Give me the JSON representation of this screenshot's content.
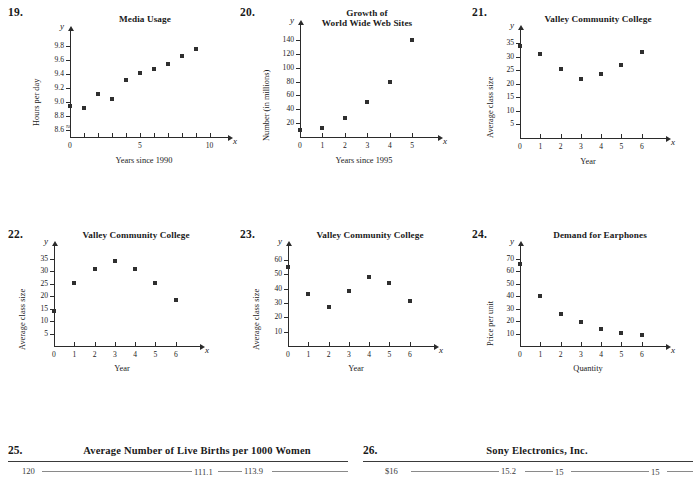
{
  "page": {
    "background": "#ffffff",
    "ink": "#1a1a1a"
  },
  "problems": [
    {
      "number": "19.",
      "title": "Media Usage",
      "xlabel": "Years since 1990",
      "ylabel": "Hours per day",
      "xvar": "x",
      "yvar": "y"
    },
    {
      "number": "20.",
      "title_line1": "Growth of",
      "title_line2": "World Wide Web Sites",
      "xlabel": "Years since 1995",
      "ylabel": "Number (in millions)",
      "xvar": "x",
      "yvar": "y"
    },
    {
      "number": "21.",
      "title": "Valley Community College",
      "xlabel": "Year",
      "ylabel": "Average class size",
      "xvar": "x",
      "yvar": "y"
    },
    {
      "number": "22.",
      "title": "Valley Community College",
      "xlabel": "Year",
      "ylabel": "Average class size",
      "xvar": "x",
      "yvar": "y"
    },
    {
      "number": "23.",
      "title": "Valley Community College",
      "xlabel": "Year",
      "ylabel": "Average class size",
      "xvar": "x",
      "yvar": "y"
    },
    {
      "number": "24.",
      "title": "Demand for Earphones",
      "xlabel": "Quantity",
      "ylabel": "Price per unit",
      "xvar": "x",
      "yvar": "y"
    }
  ],
  "tables": [
    {
      "number": "25.",
      "title": "Average Number of Live Births per 1000 Women",
      "first_value": "120",
      "values": [
        "111.1",
        "113.9"
      ]
    },
    {
      "number": "26.",
      "title": "Sony Electronics, Inc.",
      "first_value": "$16",
      "values": [
        "15.2",
        "15",
        "15"
      ]
    }
  ],
  "chart_data": [
    {
      "id": "p19",
      "type": "scatter",
      "title": "Media Usage",
      "xlabel": "Years since 1990",
      "ylabel": "Hours per day",
      "x": [
        0,
        1,
        2,
        3,
        4,
        5,
        6,
        7,
        8,
        9
      ],
      "values": [
        8.95,
        8.92,
        9.12,
        9.05,
        9.32,
        9.41,
        9.47,
        9.55,
        9.66,
        9.76
      ],
      "xlim": [
        0,
        10.6
      ],
      "ylim": [
        8.5,
        9.9
      ],
      "xticks": [
        0,
        1,
        2,
        3,
        4,
        5,
        6,
        7,
        8,
        9,
        10
      ],
      "xticklabels": [
        "0",
        "",
        "",
        "",
        "",
        "5",
        "",
        "",
        "",
        "",
        "10"
      ],
      "yticks": [
        8.6,
        8.8,
        9.0,
        9.2,
        9.4,
        9.6,
        9.8
      ],
      "yticklabels": [
        "8.6",
        "8.8",
        "9.0",
        "9.2",
        "9.4",
        "9.6",
        "9.8"
      ],
      "y_axis_broken": true,
      "grid": false,
      "legend": "none"
    },
    {
      "id": "p20",
      "type": "scatter",
      "title": "Growth of World Wide Web Sites",
      "xlabel": "Years since 1995",
      "ylabel": "Number (in millions)",
      "x": [
        0,
        1,
        2,
        3,
        4,
        5
      ],
      "values": [
        10,
        13,
        28,
        50,
        79,
        140
      ],
      "xlim": [
        0,
        5.7
      ],
      "ylim": [
        0,
        150
      ],
      "xticks": [
        0,
        1,
        2,
        3,
        4,
        5
      ],
      "xticklabels": [
        "0",
        "1",
        "2",
        "3",
        "4",
        "5"
      ],
      "yticks": [
        20,
        40,
        60,
        80,
        100,
        120,
        140
      ],
      "yticklabels": [
        "20",
        "40",
        "60",
        "80",
        "100",
        "120",
        "140"
      ],
      "y_axis_broken": false,
      "grid": false,
      "legend": "none"
    },
    {
      "id": "p21",
      "type": "scatter",
      "title": "Valley Community College",
      "xlabel": "Year",
      "ylabel": "Average class size",
      "x": [
        0,
        1,
        2,
        3,
        4,
        5,
        6
      ],
      "values": [
        34,
        31,
        25.5,
        22,
        23.5,
        27,
        32
      ],
      "xlim": [
        0,
        6.7
      ],
      "ylim": [
        0,
        37
      ],
      "xticks": [
        0,
        1,
        2,
        3,
        4,
        5,
        6
      ],
      "xticklabels": [
        "0",
        "1",
        "2",
        "3",
        "4",
        "5",
        "6"
      ],
      "yticks": [
        5,
        10,
        15,
        20,
        25,
        30,
        35
      ],
      "yticklabels": [
        "5",
        "10",
        "15",
        "20",
        "25",
        "30",
        "35"
      ],
      "y_axis_broken": false,
      "grid": false,
      "legend": "none"
    },
    {
      "id": "p22",
      "type": "scatter",
      "title": "Valley Community College",
      "xlabel": "Year",
      "ylabel": "Average class size",
      "x": [
        0,
        1,
        2,
        3,
        4,
        5,
        6
      ],
      "values": [
        14,
        25.5,
        31,
        34,
        31,
        25.5,
        18.5
      ],
      "xlim": [
        0,
        6.7
      ],
      "ylim": [
        0,
        37
      ],
      "xticks": [
        0,
        1,
        2,
        3,
        4,
        5,
        6
      ],
      "xticklabels": [
        "0",
        "1",
        "2",
        "3",
        "4",
        "5",
        "6"
      ],
      "yticks": [
        5,
        10,
        15,
        20,
        25,
        30,
        35
      ],
      "yticklabels": [
        "5",
        "10",
        "15",
        "20",
        "25",
        "30",
        "35"
      ],
      "y_axis_broken": false,
      "grid": false,
      "legend": "none"
    },
    {
      "id": "p23",
      "type": "scatter",
      "title": "Valley Community College",
      "xlabel": "Year",
      "ylabel": "Average class size",
      "x": [
        0,
        1,
        2,
        3,
        4,
        5,
        6
      ],
      "values": [
        55,
        36,
        27,
        38,
        48,
        44,
        31.5
      ],
      "xlim": [
        0,
        6.7
      ],
      "ylim": [
        0,
        64
      ],
      "xticks": [
        0,
        1,
        2,
        3,
        4,
        5,
        6
      ],
      "xticklabels": [
        "0",
        "1",
        "2",
        "3",
        "4",
        "5",
        "6"
      ],
      "yticks": [
        10,
        20,
        30,
        40,
        50,
        60
      ],
      "yticklabels": [
        "10",
        "20",
        "30",
        "40",
        "50",
        "60"
      ],
      "y_axis_broken": false,
      "grid": false,
      "legend": "none"
    },
    {
      "id": "p24",
      "type": "scatter",
      "title": "Demand for Earphones",
      "xlabel": "Quantity",
      "ylabel": "Price per unit",
      "x": [
        0,
        1,
        2,
        3,
        4,
        5,
        6
      ],
      "values": [
        66,
        40,
        26,
        19.5,
        14,
        10.5,
        8.5
      ],
      "xlim": [
        0,
        6.7
      ],
      "ylim": [
        0,
        74
      ],
      "xticks": [
        0,
        1,
        2,
        3,
        4,
        5,
        6
      ],
      "xticklabels": [
        "0",
        "1",
        "2",
        "3",
        "4",
        "5",
        "6"
      ],
      "yticks": [
        10,
        20,
        30,
        40,
        50,
        60,
        70
      ],
      "yticklabels": [
        "10",
        "20",
        "30",
        "40",
        "50",
        "60",
        "70"
      ],
      "y_axis_broken": false,
      "grid": false,
      "legend": "none"
    }
  ]
}
